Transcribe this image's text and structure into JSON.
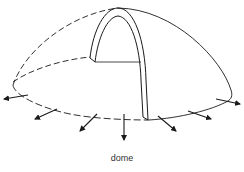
{
  "figure": {
    "caption": "dome",
    "stroke_color": "#1a1a1a",
    "background": "#ffffff",
    "elements": {
      "dome_outline": "hemispherical dome with dashed hidden edges",
      "arch": "single arch cutaway inside dome",
      "arrows": {
        "count": 7,
        "meaning": "outward thrust at base rim"
      }
    }
  }
}
